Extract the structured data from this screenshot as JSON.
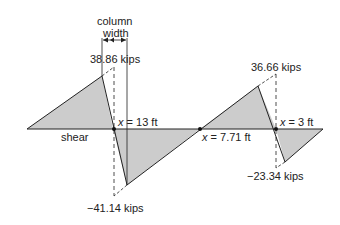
{
  "diagram": {
    "baseline_label": "shear",
    "column_label_line1": "column",
    "column_label_line2": "width",
    "annotations": {
      "peak_left": "38.86 kips",
      "trough_left": "−41.14 kips",
      "peak_right": "36.66 kips",
      "trough_right": "−23.34 kips",
      "zero1_var": "x",
      "zero1_val": " = 13 ft",
      "zero2_var": "x",
      "zero2_val": " = 7.71 ft",
      "zero3_var": "x",
      "zero3_val": " = 3 ft"
    },
    "colors": {
      "fill": "#cccccc",
      "line": "#222222",
      "text": "#222222"
    }
  }
}
